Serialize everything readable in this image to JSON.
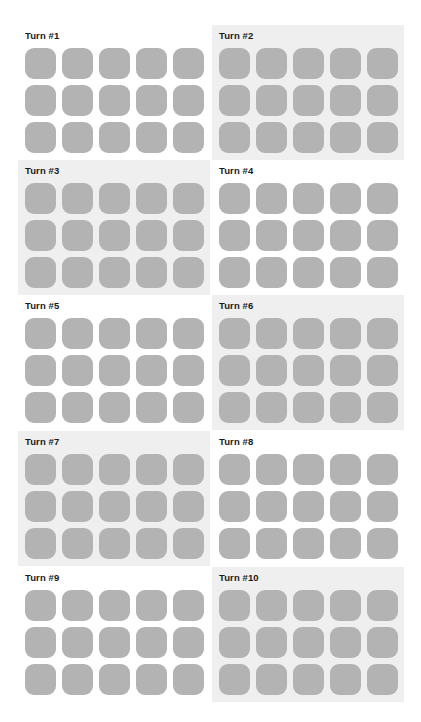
{
  "colors": {
    "tile": "#b3b3b3",
    "panel_shaded": "#efefef",
    "panel_plain": "#ffffff",
    "title": "#1a1a1a"
  },
  "grid": {
    "rows": 3,
    "cols": 5
  },
  "panels": [
    {
      "title": "Turn #1",
      "shaded": false
    },
    {
      "title": "Turn #2",
      "shaded": true
    },
    {
      "title": "Turn #3",
      "shaded": true
    },
    {
      "title": "Turn #4",
      "shaded": false
    },
    {
      "title": "Turn #5",
      "shaded": false
    },
    {
      "title": "Turn #6",
      "shaded": true
    },
    {
      "title": "Turn #7",
      "shaded": true
    },
    {
      "title": "Turn #8",
      "shaded": false
    },
    {
      "title": "Turn #9",
      "shaded": false
    },
    {
      "title": "Turn #10",
      "shaded": true
    }
  ]
}
